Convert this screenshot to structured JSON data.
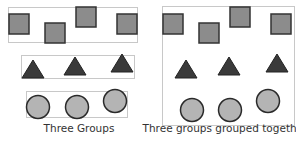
{
  "colors": {
    "box_stroke": "#c8c8c8",
    "square_fill": "#8c8c8c",
    "square_stroke": "#333333",
    "triangle_fill": "#3a3a3a",
    "triangle_stroke": "#222222",
    "circle_fill": "#b4b4b4",
    "circle_stroke": "#2a2a2a",
    "caption": "#333333"
  },
  "left_panel": {
    "caption": "Three Groups",
    "groups": [
      {
        "name": "squares",
        "shape": "square",
        "count": 4
      },
      {
        "name": "triangles",
        "shape": "triangle",
        "count": 3
      },
      {
        "name": "circles",
        "shape": "circle",
        "count": 3
      }
    ]
  },
  "right_panel": {
    "caption": "Three groups grouped together",
    "groups": [
      {
        "name": "squares",
        "shape": "square",
        "count": 4
      },
      {
        "name": "triangles",
        "shape": "triangle",
        "count": 3
      },
      {
        "name": "circles",
        "shape": "circle",
        "count": 3
      }
    ]
  }
}
